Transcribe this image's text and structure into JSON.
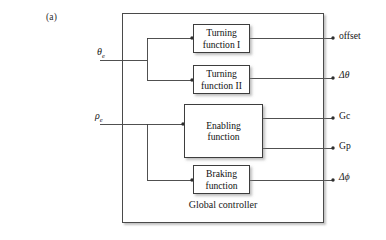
{
  "figure": {
    "panel_label": "(a)",
    "caption": "Global controller"
  },
  "inputs": [
    {
      "id": "theta-e",
      "symbol": "θ",
      "subscript": "e",
      "label": "θe"
    },
    {
      "id": "rho-e",
      "symbol": "ρ",
      "subscript": "e",
      "label": "ρe"
    }
  ],
  "blocks": [
    {
      "id": "turning-1",
      "line1": "Turning",
      "line2": "function I"
    },
    {
      "id": "turning-2",
      "line1": "Turning",
      "line2": "function II"
    },
    {
      "id": "enabling",
      "line1": "Enabling",
      "line2": "function"
    },
    {
      "id": "braking",
      "line1": "Braking",
      "line2": "function"
    }
  ],
  "outputs": [
    {
      "id": "offset",
      "label": "offset"
    },
    {
      "id": "dtheta",
      "label": "Δθ"
    },
    {
      "id": "gc",
      "label": "Gc"
    },
    {
      "id": "gp",
      "label": "Gp"
    },
    {
      "id": "dphi",
      "label": "Δϕ"
    }
  ],
  "colors": {
    "stroke": "#3d3d3d",
    "outer_stroke": "#4a4a4a",
    "text": "#161616",
    "background": "#ffffff",
    "shadow": "rgba(125,125,125,0.5)"
  }
}
